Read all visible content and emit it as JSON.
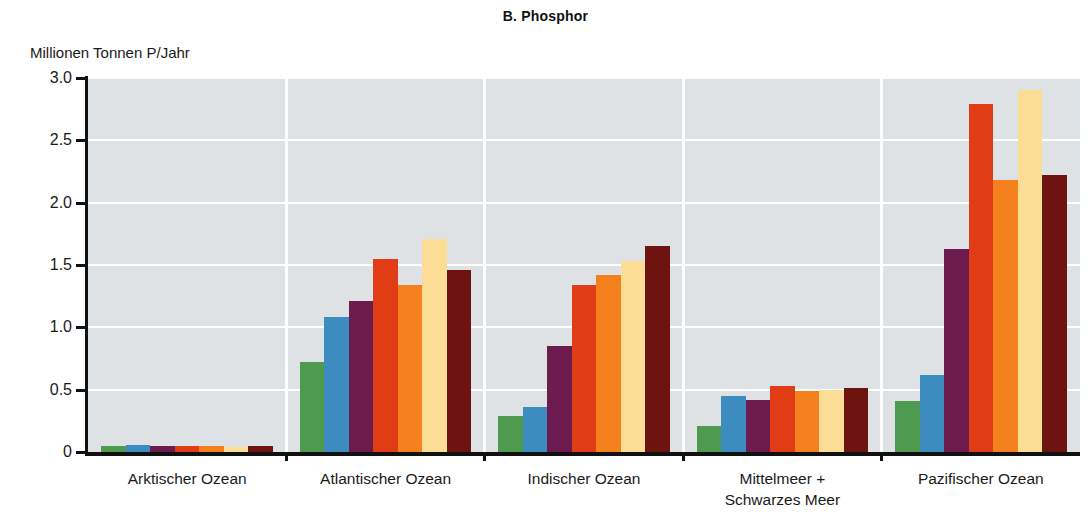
{
  "chart_data": {
    "type": "bar",
    "title": "B. Phosphor",
    "xlabel": "",
    "ylabel": "Millionen Tonnen P/Jahr",
    "ylim": [
      0,
      3.0
    ],
    "yticks": [
      "0",
      "0.5",
      "1.0",
      "1.5",
      "2.0",
      "2.5",
      "3.0"
    ],
    "ytick_values": [
      0,
      0.5,
      1.0,
      1.5,
      2.0,
      2.5,
      3.0
    ],
    "grid": "horizontal and vertical white gridlines on light gray panel",
    "legend": "none",
    "categories": [
      "Arktischer Ozean",
      "Atlantischer Ozean",
      "Indischer Ozean",
      "Mittelmeer +\nSchwarzes Meer",
      "Pazifischer Ozean"
    ],
    "category_lines": [
      [
        "Arktischer Ozean"
      ],
      [
        "Atlantischer Ozean"
      ],
      [
        "Indischer Ozean"
      ],
      [
        "Mittelmeer +",
        "Schwarzes Meer"
      ],
      [
        "Pazifischer Ozean"
      ]
    ],
    "series": [
      {
        "name": "Serie 1",
        "color": "#4e9a4e",
        "values": [
          0.05,
          0.72,
          0.29,
          0.21,
          0.41
        ]
      },
      {
        "name": "Serie 2",
        "color": "#3d8cbf",
        "values": [
          0.06,
          1.08,
          0.36,
          0.45,
          0.62
        ]
      },
      {
        "name": "Serie 3",
        "color": "#6d1a4e",
        "values": [
          0.05,
          1.21,
          0.85,
          0.42,
          1.63
        ]
      },
      {
        "name": "Serie 4",
        "color": "#e03c16",
        "values": [
          0.05,
          1.55,
          1.34,
          0.53,
          2.79
        ]
      },
      {
        "name": "Serie 5",
        "color": "#f4801e",
        "values": [
          0.05,
          1.34,
          1.42,
          0.49,
          2.18
        ]
      },
      {
        "name": "Serie 6",
        "color": "#fbdd96",
        "values": [
          0.04,
          1.71,
          1.53,
          0.5,
          2.9
        ]
      },
      {
        "name": "Serie 7",
        "color": "#6e1410",
        "values": [
          0.05,
          1.46,
          1.65,
          0.51,
          2.22
        ]
      }
    ],
    "plot_background": "#dfe2e5",
    "gridline_color": "#ffffff",
    "axis_color": "#111111",
    "page_background": "#ffffff"
  }
}
